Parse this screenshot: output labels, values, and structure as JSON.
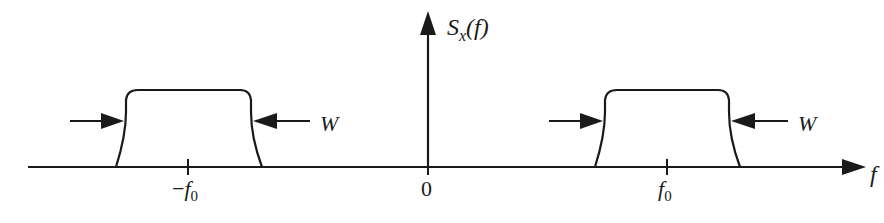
{
  "diagram": {
    "type": "bandpass power spectral density",
    "y_axis_label": {
      "symbol": "S",
      "subscript": "x",
      "arg": "(f)"
    },
    "x_axis_label": "f",
    "ticks": [
      {
        "label_sign": "−",
        "label": "f",
        "sub": "0",
        "position": "-f0"
      },
      {
        "label": "0",
        "position": "0"
      },
      {
        "label": "f",
        "sub": "0",
        "position": "f0"
      }
    ],
    "bands": [
      {
        "center": "-f0",
        "width_label": "W"
      },
      {
        "center": "f0",
        "width_label": "W"
      }
    ],
    "colors": {
      "stroke": "#1a1a1a",
      "background": "#ffffff"
    }
  }
}
